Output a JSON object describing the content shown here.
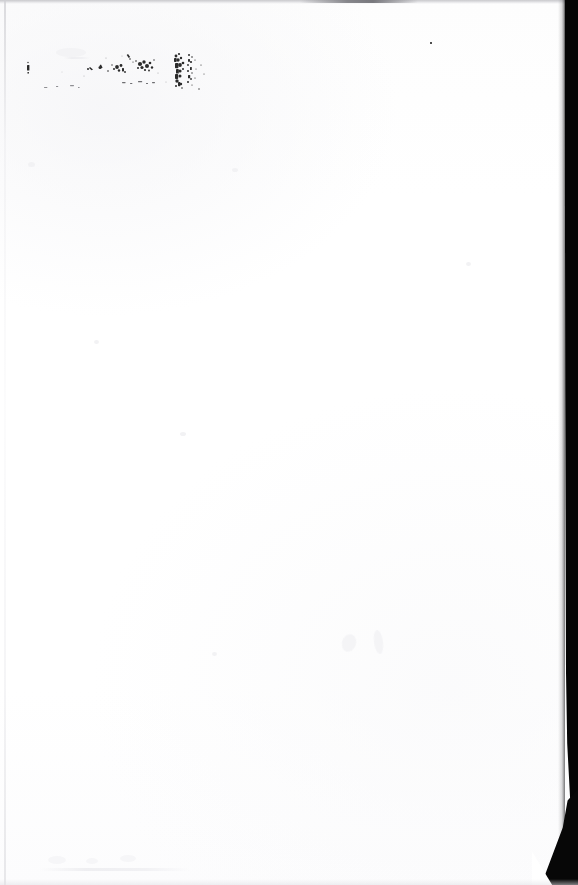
{
  "document": {
    "type": "scanned-page",
    "page_condition": "blank",
    "legible_text": "",
    "note": "No legible text is present in the scan.",
    "background_color": "#ffffff",
    "paper_color": "#fefefe",
    "ink_color": "#2b2b2b",
    "scanner_background_color": "#050505",
    "edge_band_color": "#c9c9cc",
    "width_px": 578,
    "height_px": 885
  },
  "regions": {
    "top_edge_band": {
      "name": "top-scan-edge-band",
      "color": "#c9c9cc",
      "height_px": 4
    },
    "left_edge_line": {
      "name": "left-paper-edge",
      "color": "#d0d0d4",
      "x_px": 4
    },
    "right_black_strip": {
      "name": "scanner-background-strip",
      "color": "#050505",
      "width_px": 20,
      "position": "right"
    },
    "bottom_right_corner": {
      "name": "torn-curled-corner",
      "color": "#070707"
    }
  },
  "ink_marks": {
    "label": "illegible-ink-speckles",
    "description": "Faded, broken ink residue in the upper-left region; characters are not recoverable.",
    "bounding_box": {
      "x": 25,
      "y": 45,
      "width": 180,
      "height": 52
    },
    "density": "sparse-to-dense-right",
    "clusters": [
      {
        "name": "left-speck",
        "x": 28,
        "y": 68,
        "size": 4
      },
      {
        "name": "mid-scatter",
        "x": 95,
        "y": 70,
        "size": 14
      },
      {
        "name": "dense-blot",
        "x": 178,
        "y": 52,
        "size": 26
      },
      {
        "name": "isolated-speck",
        "x": 430,
        "y": 43,
        "size": 3
      }
    ]
  },
  "faint_marks": [
    {
      "name": "ghost-wisp-mid",
      "x": 345,
      "y": 640
    },
    {
      "name": "ghost-wisp-mid-right",
      "x": 378,
      "y": 645
    },
    {
      "name": "ghost-row-bottom",
      "x": 55,
      "y": 860
    }
  ]
}
